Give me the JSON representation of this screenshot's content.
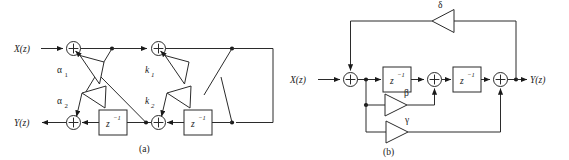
{
  "figure": {
    "type": "signal-flow-graph-pair",
    "background": "#ffffff",
    "line_color": "#2b2b2b",
    "text_color": "#1a1a1a"
  },
  "panel_a": {
    "caption": "(a)",
    "input_label": "X(z)",
    "output_label": "Y(z)",
    "description": "two-stage lattice filter",
    "stages": [
      {
        "gain_upper": "α",
        "gain_upper_sub": "1",
        "gain_lower": "α",
        "gain_lower_sub": "2",
        "delay_label": "z",
        "delay_exp": "−1"
      },
      {
        "gain_upper": "k",
        "gain_upper_sub": "1",
        "gain_lower": "k",
        "gain_lower_sub": "2",
        "delay_label": "z",
        "delay_exp": "−1"
      }
    ],
    "adders": [
      "+",
      "+",
      "+",
      "+"
    ],
    "delay_blocks": [
      {
        "base": "z",
        "exponent": "−1"
      },
      {
        "base": "z",
        "exponent": "−1"
      }
    ]
  },
  "panel_b": {
    "caption": "(b)",
    "input_label": "X(z)",
    "output_label": "Y(z)",
    "description": "direct form structure with feedback",
    "gains": [
      {
        "name": "delta",
        "label": "δ",
        "direction": "left"
      },
      {
        "name": "beta",
        "label": "β",
        "direction": "right"
      },
      {
        "name": "gamma",
        "label": "γ",
        "direction": "right"
      }
    ],
    "adders": [
      "+",
      "+",
      "+"
    ],
    "delay_blocks": [
      {
        "base": "z",
        "exponent": "−1"
      },
      {
        "base": "z",
        "exponent": "−1"
      }
    ]
  }
}
